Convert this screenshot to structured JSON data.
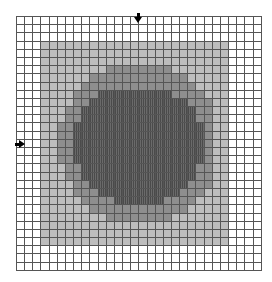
{
  "figure": {
    "columns": 30,
    "rows": 31,
    "legend_levels": [
      {
        "level": 0,
        "name": "empty",
        "color": "#ffffff"
      },
      {
        "level": 1,
        "name": "light",
        "color": "#bdbdbd"
      },
      {
        "level": 2,
        "name": "medium",
        "color": "#8e8e8e"
      },
      {
        "level": 3,
        "name": "dark",
        "color": "#555555"
      }
    ],
    "cells": [
      "000000000000000000000000000000",
      "000000000000000000000000000000",
      "000000000000000000000000000000",
      "000111111111111111111111110000",
      "000111111111111111111111110000",
      "000111111111111111111111110000",
      "000111111112222222211111110000",
      "000111111222222222222111110000",
      "000111112222222222222211110000",
      "000111122233333333322221110000",
      "000111122333333333333222110000",
      "000111223333333333333322110000",
      "000111223333333333333322110000",
      "000112233333333333333332110000",
      "000112233333333333333332110000",
      "000112233333333333333332110000",
      "000112233333333333333332110000",
      "000112233333333333333332110000",
      "000111223333333333333322110000",
      "000111223333333333333322110000",
      "000111122333333333333222110000",
      "000111122233333333332221110000",
      "000111112222333333222211110000",
      "000111111222222222222111110000",
      "000111111112222222211111110000",
      "000111111111111111111111110000",
      "000111111111111111111111110000",
      "000111111111111111111111110000",
      "000000000000000000000000000000",
      "000000000000000000000000000000",
      "000000000000000000000000000000"
    ],
    "markers": [
      {
        "name": "column-marker",
        "direction": "down",
        "column": 15
      },
      {
        "name": "row-marker",
        "direction": "right",
        "row": 15
      }
    ]
  }
}
